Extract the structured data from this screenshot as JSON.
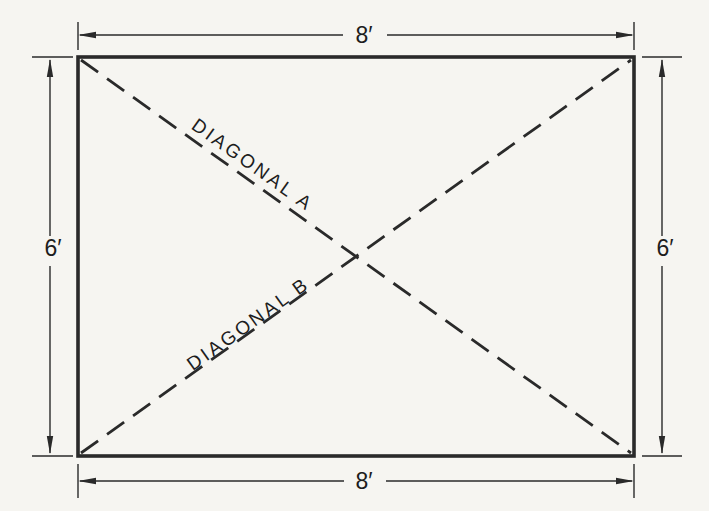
{
  "colors": {
    "background": "#f6f5f1",
    "line": "#2a2a2a",
    "text": "#1d1d1d"
  },
  "rectangle": {
    "top_dimension": "8′",
    "bottom_dimension": "8′",
    "left_dimension": "6′",
    "right_dimension": "6′"
  },
  "diagonals": {
    "a_label": "DIAGONAL A",
    "b_label": "DIAGONAL B"
  }
}
